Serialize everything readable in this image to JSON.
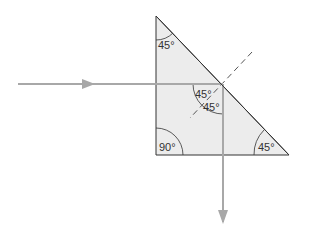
{
  "diagram": {
    "colors": {
      "prism_fill": "#ececec",
      "prism_edge": "#333333",
      "ray": "#a8a8a8",
      "normal": "#555555",
      "background": "#ffffff"
    },
    "prism": {
      "vertices": {
        "apex": [
          156,
          16
        ],
        "right_angle": [
          156,
          155
        ],
        "base_right": [
          289,
          155
        ]
      }
    },
    "angles": {
      "top": "45°",
      "right_angle": "90°",
      "bottom_right": "45°",
      "incidence": "45°",
      "reflection": "45°"
    },
    "rays": {
      "incident": {
        "from": [
          18,
          84
        ],
        "to": [
          223,
          84
        ],
        "direction": "right"
      },
      "reflected": {
        "from": [
          223,
          84
        ],
        "to": [
          223,
          222
        ],
        "direction": "down"
      }
    },
    "normal_line": {
      "from": [
        252,
        52
      ],
      "to": [
        190,
        118
      ],
      "style": "dashed"
    }
  }
}
